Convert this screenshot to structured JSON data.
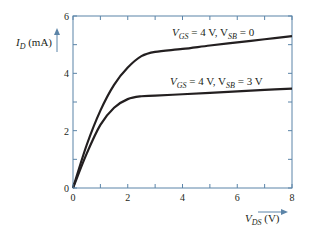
{
  "chart_data": {
    "type": "line",
    "title": "",
    "xlabel": "V_DS (V)",
    "ylabel": "I_D (mA)",
    "xlim": [
      0,
      8
    ],
    "ylim": [
      0,
      6
    ],
    "x_ticks": [
      0,
      2,
      4,
      6,
      8
    ],
    "y_ticks": [
      0,
      2,
      4,
      6
    ],
    "grid": false,
    "colors": {
      "axis": "#5b84a8",
      "curve": "#231f20"
    },
    "series": [
      {
        "name": "V_GS = 4 V, V_SB = 0",
        "x": [
          0,
          0.5,
          1.0,
          1.5,
          2.0,
          2.5,
          3.0,
          4.0,
          5.0,
          6.0,
          7.0,
          8.0
        ],
        "y": [
          0,
          1.5,
          2.7,
          3.6,
          4.2,
          4.6,
          4.75,
          4.85,
          4.97,
          5.08,
          5.19,
          5.3
        ]
      },
      {
        "name": "V_GS = 4 V, V_SB = 3 V",
        "x": [
          0,
          0.5,
          1.0,
          1.5,
          2.0,
          2.5,
          3.0,
          4.0,
          5.0,
          6.0,
          7.0,
          8.0
        ],
        "y": [
          0,
          1.2,
          2.2,
          2.8,
          3.1,
          3.2,
          3.22,
          3.27,
          3.32,
          3.37,
          3.42,
          3.47
        ]
      }
    ],
    "annotations": [
      {
        "text_main": "V",
        "sub1": "GS",
        "mid": " = 4 V, V",
        "sub2": "SB",
        "tail": " = 0"
      },
      {
        "text_main": "V",
        "sub1": "GS",
        "mid": " = 4 V, V",
        "sub2": "SB",
        "tail": " = 3 V"
      }
    ],
    "axis_labels": {
      "y": {
        "main": "I",
        "sub": "D",
        "unit": " (mA)"
      },
      "x": {
        "main": "V",
        "sub": "DS",
        "unit": " (V)"
      }
    }
  }
}
